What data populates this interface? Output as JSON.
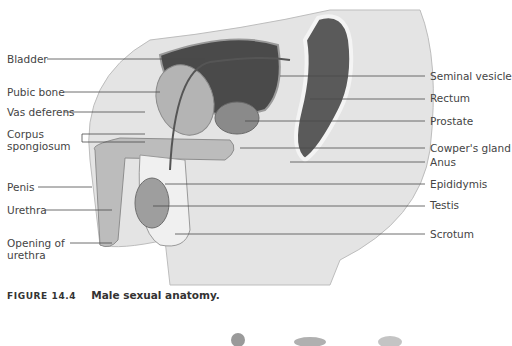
{
  "figure": {
    "left_labels": [
      {
        "text": "Bladder",
        "x": 7,
        "y": 53
      },
      {
        "text": "Pubic bone",
        "x": 7,
        "y": 86
      },
      {
        "text": "Vas deferens",
        "x": 7,
        "y": 106
      },
      {
        "text": "Corpus",
        "x": 7,
        "y": 128
      },
      {
        "text": "spongiosum",
        "x": 7,
        "y": 140
      },
      {
        "text": "Penis",
        "x": 7,
        "y": 181
      },
      {
        "text": "Urethra",
        "x": 7,
        "y": 204
      },
      {
        "text": "Opening of",
        "x": 7,
        "y": 237
      },
      {
        "text": "urethra",
        "x": 7,
        "y": 249
      }
    ],
    "right_labels": [
      {
        "text": "Seminal vesicle",
        "x": 430,
        "y": 70
      },
      {
        "text": "Rectum",
        "x": 430,
        "y": 92
      },
      {
        "text": "Prostate",
        "x": 430,
        "y": 115
      },
      {
        "text": "Cowper's gland",
        "x": 430,
        "y": 142
      },
      {
        "text": "Anus",
        "x": 430,
        "y": 156
      },
      {
        "text": "Epididymis",
        "x": 430,
        "y": 178
      },
      {
        "text": "Testis",
        "x": 430,
        "y": 199
      },
      {
        "text": "Scrotum",
        "x": 430,
        "y": 228
      }
    ]
  },
  "caption": {
    "number": "FIGURE 14.4",
    "title": "Male sexual anatomy."
  }
}
